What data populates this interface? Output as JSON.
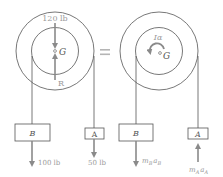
{
  "left_fbd": {
    "weight_label": "120 lb",
    "center_label": "G",
    "reaction_label": "R",
    "block_b_label": "B",
    "block_a_label": "A",
    "block_b_force": "100 lb",
    "block_a_force": "50 lb"
  },
  "equals": "=",
  "right_kd": {
    "moment_label": "Iα",
    "center_label": "G",
    "block_b_label": "B",
    "block_a_label": "A",
    "block_b_inertia": "m_B a_B",
    "block_a_inertia": "m_A a_A",
    "block_b_inertia_main": "m",
    "block_b_inertia_sub1": "B",
    "block_b_inertia_mid": "a",
    "block_b_inertia_sub2": "B",
    "block_a_inertia_main": "m",
    "block_a_inertia_sub1": "A",
    "block_a_inertia_mid": "a",
    "block_a_inertia_sub2": "A"
  },
  "colors": {
    "line": "#555555",
    "arrow": "#8a8a8a",
    "text": "#555555",
    "faint_text": "#9a9a9a"
  }
}
